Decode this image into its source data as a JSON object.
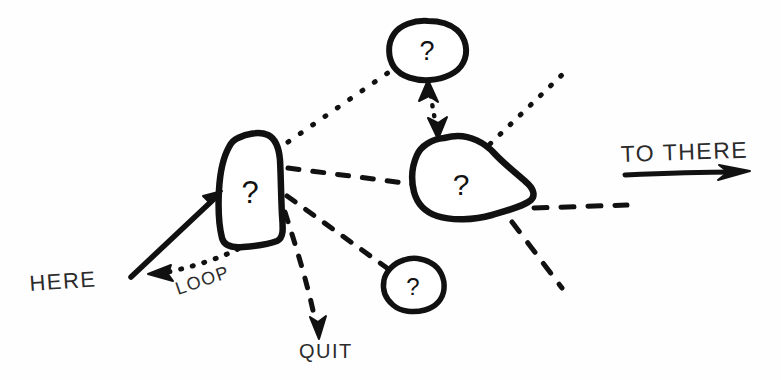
{
  "diagram": {
    "background_color": "#fefefe",
    "ink_color": "#111111",
    "label_color": "#2b2b2b",
    "nodes": [
      {
        "id": "node-left",
        "name": "left-question-node",
        "label": "?",
        "shape": "rounded-rectangle-blob",
        "cx": 250,
        "cy": 190
      },
      {
        "id": "node-top",
        "name": "top-question-node",
        "label": "?",
        "shape": "round-blob",
        "cx": 428,
        "cy": 49
      },
      {
        "id": "node-middle",
        "name": "middle-question-node",
        "label": "?",
        "shape": "irregular-blob",
        "cx": 462,
        "cy": 182
      },
      {
        "id": "node-bottom",
        "name": "bottom-question-node",
        "label": "?",
        "shape": "small-blob",
        "cx": 413,
        "cy": 285
      }
    ],
    "labels": [
      {
        "id": "label-here",
        "name": "here-label",
        "text": "HERE",
        "x": 30,
        "y": 291,
        "rotation": -4,
        "size": 22
      },
      {
        "id": "label-loop",
        "name": "loop-label",
        "text": "LOOP",
        "x": 178,
        "y": 295,
        "rotation": -19,
        "size": 18
      },
      {
        "id": "label-quit",
        "name": "quit-label",
        "text": "QUIT",
        "x": 299,
        "y": 358,
        "rotation": 0,
        "size": 20
      },
      {
        "id": "label-to-there",
        "name": "to-there-label",
        "text": "TO THERE",
        "x": 621,
        "y": 162,
        "rotation": -2,
        "size": 23
      }
    ],
    "edges": [
      {
        "id": "edge-here-in",
        "name": "here-entry-arrow",
        "style": "solid",
        "from": "HERE",
        "to": "node-left",
        "arrow": "end"
      },
      {
        "id": "edge-loop",
        "name": "loop-return-arrow",
        "style": "dotted",
        "from": "node-left",
        "to": "LOOP",
        "arrow": "end"
      },
      {
        "id": "edge-left-top",
        "name": "left-to-top-link",
        "style": "dotted",
        "from": "node-left",
        "to": "node-top",
        "arrow": "none"
      },
      {
        "id": "edge-left-middle",
        "name": "left-to-middle-link",
        "style": "dashed",
        "from": "node-left",
        "to": "node-middle",
        "arrow": "none"
      },
      {
        "id": "edge-left-bottom",
        "name": "left-to-bottom-link",
        "style": "dashed",
        "from": "node-left",
        "to": "node-bottom",
        "arrow": "none"
      },
      {
        "id": "edge-quit",
        "name": "quit-exit-arrow",
        "style": "dashed",
        "from": "node-left",
        "to": "QUIT",
        "arrow": "end"
      },
      {
        "id": "edge-top-middle",
        "name": "top-middle-bidirectional-arrow",
        "style": "dotted",
        "from": "node-middle",
        "to": "node-top",
        "arrow": "both"
      },
      {
        "id": "edge-middle-upright",
        "name": "middle-upper-right-link",
        "style": "dotted",
        "from": "node-middle",
        "to": "offscreen-upper-right",
        "arrow": "none"
      },
      {
        "id": "edge-middle-right",
        "name": "middle-right-link",
        "style": "dashed",
        "from": "node-middle",
        "to": "offscreen-right",
        "arrow": "none"
      },
      {
        "id": "edge-middle-downright",
        "name": "middle-lower-right-link",
        "style": "dashed",
        "from": "node-middle",
        "to": "offscreen-lower-right",
        "arrow": "none"
      },
      {
        "id": "edge-to-there",
        "name": "to-there-arrow",
        "style": "solid",
        "from": "TO THERE",
        "to": "offscreen-right",
        "arrow": "end"
      }
    ]
  }
}
